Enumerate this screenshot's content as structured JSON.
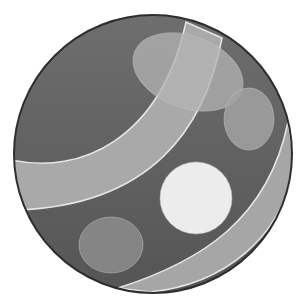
{
  "image": {
    "subject": "striped spotted ball",
    "width": 306,
    "height": 303,
    "background": "#ffffff"
  },
  "ball": {
    "cx": 153,
    "cy": 154,
    "r": 139,
    "fill_top": "#6e6e6e",
    "fill_bottom": "#555555",
    "outline": "#2e2e2e"
  },
  "bands": [
    {
      "name": "upper-band",
      "path": "M12 160 C 80 175, 160 140, 186 22 L 222 38 C 205 130, 150 205, 18 210 Z",
      "fill": "#a9a9a9",
      "edge": "#e6e6e6"
    },
    {
      "name": "lower-band",
      "path": "M118 288 C 200 262, 268 220, 288 122 L 294 160 C 285 240, 220 285, 150 292 Z",
      "fill": "#a6a6a6",
      "edge": "#e6e6e6"
    }
  ],
  "spots": [
    {
      "name": "top-large-spot",
      "cx": 188,
      "cy": 72,
      "rx": 57,
      "ry": 36,
      "rotate": 20,
      "fill": "#b4b4b4",
      "opacity": 0.75
    },
    {
      "name": "right-spot",
      "cx": 249,
      "cy": 119,
      "rx": 25,
      "ry": 31,
      "rotate": 0,
      "fill": "#a2a2a2",
      "opacity": 0.85
    },
    {
      "name": "center-white-spot",
      "cx": 196,
      "cy": 198,
      "rx": 36,
      "ry": 36,
      "rotate": 0,
      "fill": "#ececec",
      "opacity": 1
    },
    {
      "name": "bottom-left-spot",
      "cx": 111,
      "cy": 245,
      "rx": 32,
      "ry": 28,
      "rotate": 0,
      "fill": "#8a8a8a",
      "opacity": 0.9
    }
  ]
}
